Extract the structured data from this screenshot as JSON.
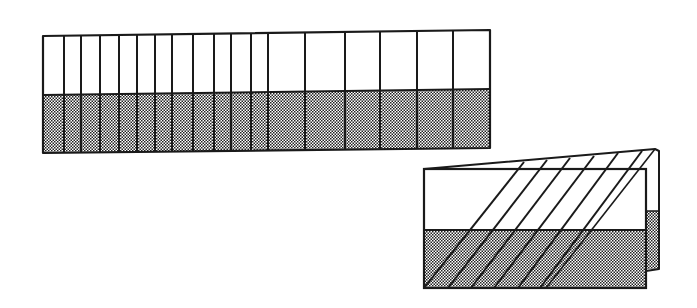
{
  "diagram": {
    "colors": {
      "ink": "#1a1a1a",
      "paper": "#ffffff",
      "shade_dark": "#222222",
      "shade_light": "#ffffff"
    },
    "flat_strip": {
      "top_left": [
        43,
        36
      ],
      "top_right": [
        490,
        30
      ],
      "band_left_y": 95,
      "band_right_y": 89,
      "bottom_left_y": 153,
      "bottom_right_y": 148,
      "divider_x": [
        64,
        81,
        100,
        119,
        137,
        155,
        172,
        193,
        214,
        231,
        251,
        268,
        305,
        345,
        380,
        417,
        453
      ]
    },
    "folded_strip": {
      "front_panel": {
        "x": 424,
        "y": 169,
        "width": 222,
        "band_y": 230,
        "bottom_y": 288
      },
      "back_panel": {
        "top_left": [
          424,
          169
        ],
        "top_right": [
          655,
          149
        ],
        "right_x": 659,
        "band_y": 211,
        "bottom_y": 269
      },
      "fold_lines": [
        {
          "bottom": [
            424,
            288
          ],
          "top": [
            524,
            162
          ]
        },
        {
          "bottom": [
            448,
            288
          ],
          "top": [
            547,
            160
          ]
        },
        {
          "bottom": [
            471,
            288
          ],
          "top": [
            570,
            158
          ]
        },
        {
          "bottom": [
            494,
            288
          ],
          "top": [
            594,
            156
          ]
        },
        {
          "bottom": [
            518,
            288
          ],
          "top": [
            618,
            153
          ]
        },
        {
          "bottom": [
            540,
            288
          ],
          "top": [
            642,
            151
          ]
        }
      ]
    }
  }
}
